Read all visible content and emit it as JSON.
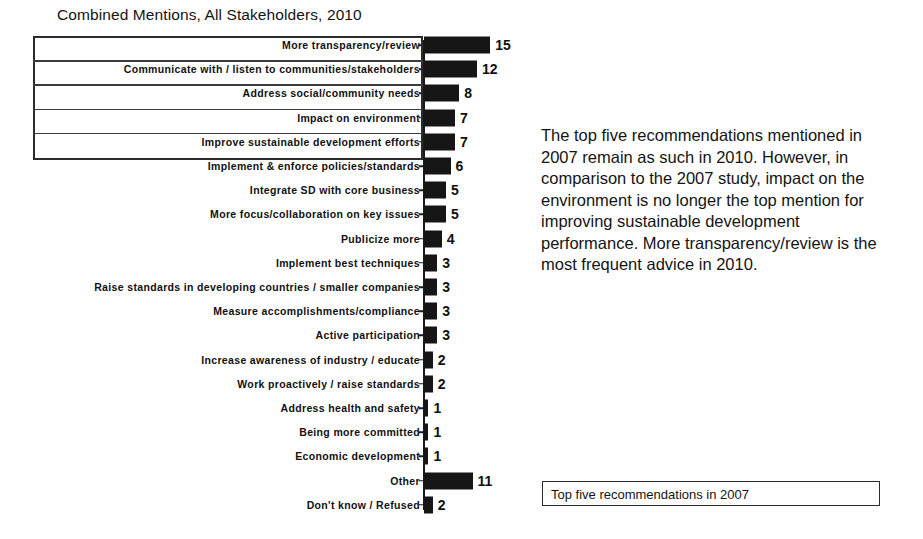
{
  "chart_data": {
    "type": "bar",
    "orientation": "horizontal",
    "title": "Combined Mentions, All Stakeholders, 2010",
    "xlabel": "",
    "ylabel": "",
    "xlim": [
      0,
      16
    ],
    "grid": false,
    "value_labels": true,
    "categories": [
      "More transparency/review",
      "Communicate with / listen to communities/stakeholders",
      "Address social/community needs",
      "Impact on environment",
      "Improve sustainable development efforts",
      "Implement & enforce policies/standards",
      "Integrate SD with core business",
      "More focus/collaboration on key issues",
      "Publicize more",
      "Implement best techniques",
      "Raise standards in developing countries / smaller companies",
      "Measure accomplishments/compliance",
      "Active participation",
      "Increase awareness of industry / educate",
      "Work proactively / raise standards",
      "Address health and safety",
      "Being more committed",
      "Economic development",
      "Other",
      "Don't know / Refused"
    ],
    "values": [
      15,
      12,
      8,
      7,
      7,
      6,
      5,
      5,
      4,
      3,
      3,
      3,
      3,
      2,
      2,
      1,
      1,
      1,
      11,
      2
    ],
    "highlighted_count": 5,
    "bar_color": "#161616"
  },
  "commentary": {
    "text": "The top five recommendations mentioned in 2007 remain as such in 2010. However, in comparison to the 2007 study, impact on the environment is no longer the top mention for improving sustainable development performance. More transparency/review is the most frequent advice in 2010."
  },
  "legend": {
    "label": "Top five recommendations in 2007"
  }
}
